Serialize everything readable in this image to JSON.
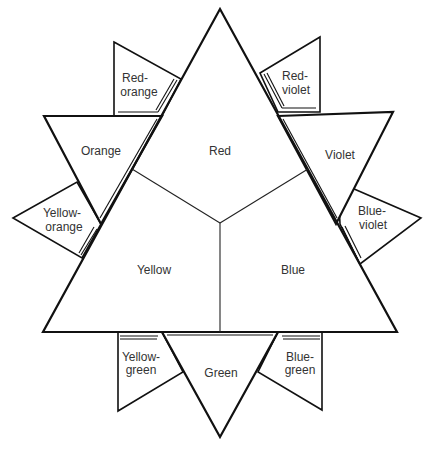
{
  "diagram": {
    "primary": {
      "red": "Red",
      "yellow": "Yellow",
      "blue": "Blue"
    },
    "secondary": {
      "orange": "Orange",
      "violet": "Violet",
      "green": "Green"
    },
    "tertiary": {
      "red_orange": [
        "Red-",
        "orange"
      ],
      "red_violet": [
        "Red-",
        "violet"
      ],
      "yellow_orange": [
        "Yellow-",
        "orange"
      ],
      "blue_violet": [
        "Blue-",
        "violet"
      ],
      "yellow_green": [
        "Yellow-",
        "green"
      ],
      "blue_green": [
        "Blue-",
        "green"
      ]
    },
    "colors": {
      "stroke": "#111111",
      "fill": "#ffffff",
      "label": "#333333"
    }
  }
}
